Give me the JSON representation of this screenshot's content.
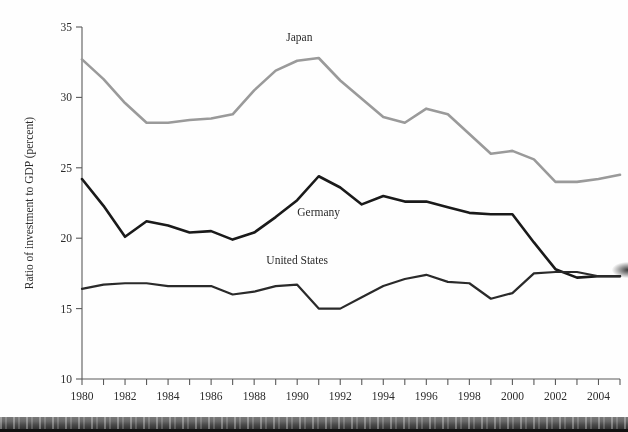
{
  "figure": {
    "name": "investment-to-gdp-ratio-chart"
  },
  "chart_data": {
    "type": "line",
    "title": "",
    "xlabel": "",
    "ylabel": "Ratio of investment to GDP (percent)",
    "xlim": [
      1980,
      2005
    ],
    "ylim": [
      10,
      35
    ],
    "yticks": [
      10,
      15,
      20,
      25,
      30,
      35
    ],
    "ytick_labels": [
      "10",
      "15",
      "20",
      "25",
      "30",
      "35"
    ],
    "xticks": [
      1980,
      1981,
      1982,
      1983,
      1984,
      1985,
      1986,
      1987,
      1988,
      1989,
      1990,
      1991,
      1992,
      1993,
      1994,
      1995,
      1996,
      1997,
      1998,
      1999,
      2000,
      2001,
      2002,
      2003,
      2004,
      2005
    ],
    "xtick_labels_shown": [
      "1980",
      "1982",
      "1984",
      "1986",
      "1988",
      "1990",
      "1992",
      "1994",
      "1996",
      "1998",
      "2000",
      "2002",
      "2004"
    ],
    "grid": false,
    "legend_position": "inline-annotations",
    "x": [
      1980,
      1981,
      1982,
      1983,
      1984,
      1985,
      1986,
      1987,
      1988,
      1989,
      1990,
      1991,
      1992,
      1993,
      1994,
      1995,
      1996,
      1997,
      1998,
      1999,
      2000,
      2001,
      2002,
      2003,
      2004,
      2005
    ],
    "series": [
      {
        "name": "Japan",
        "label": "Japan",
        "color": "#9a9a9a",
        "line_width": 2.6,
        "values": [
          32.7,
          31.3,
          29.6,
          28.2,
          28.2,
          28.4,
          28.5,
          28.8,
          30.5,
          31.9,
          32.6,
          32.8,
          31.2,
          29.9,
          28.6,
          28.2,
          29.2,
          28.8,
          27.4,
          26.0,
          26.2,
          25.6,
          24.0,
          24.0,
          24.2,
          24.5
        ]
      },
      {
        "name": "Germany",
        "label": "Germany",
        "color": "#1a1a1a",
        "line_width": 2.6,
        "values": [
          24.2,
          22.3,
          20.1,
          21.2,
          20.9,
          20.4,
          20.5,
          19.9,
          20.4,
          21.5,
          22.7,
          24.4,
          23.6,
          22.4,
          23.0,
          22.6,
          22.6,
          22.2,
          21.8,
          21.7,
          21.7,
          19.7,
          17.8,
          17.2,
          17.3,
          17.3
        ]
      },
      {
        "name": "United States",
        "label": "United States",
        "color": "#2a2a2a",
        "line_width": 2.2,
        "values": [
          16.4,
          16.7,
          16.8,
          16.8,
          16.6,
          16.6,
          16.6,
          16.0,
          16.2,
          16.6,
          16.7,
          15.0,
          15.0,
          15.8,
          16.6,
          17.1,
          17.4,
          16.9,
          16.8,
          15.7,
          16.1,
          17.5,
          17.6,
          17.6,
          17.3,
          17.3
        ]
      }
    ],
    "annotations": [
      {
        "text": "Japan",
        "x": 1990.1,
        "y": 34.0
      },
      {
        "text": "Germany",
        "x": 1991.0,
        "y": 21.6
      },
      {
        "text": "United States",
        "x": 1990.0,
        "y": 18.2
      }
    ]
  }
}
